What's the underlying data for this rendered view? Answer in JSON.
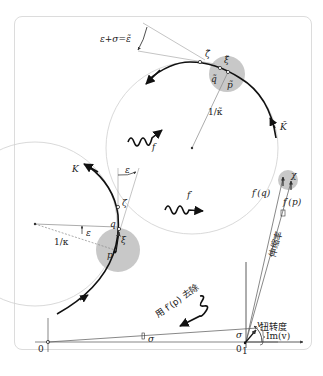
{
  "figure": {
    "top_panel": {
      "angle_label": "ε+σ=ε̃",
      "zeta_tilde": "ζ̃",
      "xi_tilde": "ξ̃",
      "q_tilde": "q̃",
      "p_tilde": "p̃",
      "radius_label": "1/κ̃",
      "curve_label": "K̃"
    },
    "map_f": {
      "label": "f"
    },
    "map_f_prime": {
      "label": "f′"
    },
    "left_panel": {
      "curve_label": "K",
      "epsilon_top": "ε",
      "epsilon_mid": "ε",
      "zeta": "ζ",
      "q": "q",
      "xi": "ξ",
      "p": "p",
      "radius_label": "1/κ"
    },
    "right_panel": {
      "chi": "χ",
      "fq": "f′(q)",
      "fp": "f′(p)",
      "stretch_label": "伸缩率",
      "twist_label": "扭转度",
      "origin": "0"
    },
    "divide_arrow": {
      "label": "用 f′(p) 去除"
    },
    "bottom_panel": {
      "origin": "0",
      "one": "1",
      "sigma_mid": "σ",
      "sigma_right": "σ",
      "v": "v",
      "im_v": "Im(v)"
    },
    "colors": {
      "disk": "#c8c8c8",
      "curve": "#111111",
      "thin": "#999999",
      "frame": "#dcdcdc"
    }
  }
}
